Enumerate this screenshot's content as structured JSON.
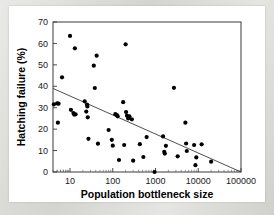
{
  "figure": {
    "background_color": "#d7d8d3",
    "card_color": "#ffffff",
    "axis_color": "#3a3a3a",
    "point_color": "#000000"
  },
  "chart_data": {
    "type": "scatter",
    "title": "",
    "xlabel": "Population bottleneck size",
    "ylabel": "Hatching failure (%)",
    "xscale": "log",
    "yscale": "linear",
    "xlim": [
      4,
      100000
    ],
    "ylim": [
      0,
      70
    ],
    "xticks": [
      10,
      100,
      1000,
      10000,
      100000
    ],
    "xtick_labels": [
      "10",
      "100",
      "1000",
      "10000",
      "100000"
    ],
    "yticks": [
      0,
      10,
      20,
      30,
      40,
      50,
      60,
      70
    ],
    "ytick_labels": [
      "0",
      "10",
      "20",
      "30",
      "40",
      "50",
      "60",
      "70"
    ],
    "grid": false,
    "legend": false,
    "series": [
      {
        "name": "populations",
        "marker": "filled-circle",
        "points": [
          [
            4.2,
            31.6
          ],
          [
            5.0,
            32.0
          ],
          [
            5.4,
            31.9
          ],
          [
            5.2,
            23.0
          ],
          [
            6.5,
            44.2
          ],
          [
            10.0,
            63.5
          ],
          [
            10.5,
            29.0
          ],
          [
            12.0,
            27.5
          ],
          [
            12.5,
            26.8
          ],
          [
            13.0,
            57.7
          ],
          [
            13.5,
            26.9
          ],
          [
            22.0,
            33.0
          ],
          [
            24.0,
            28.2
          ],
          [
            25.0,
            31.4
          ],
          [
            25.5,
            30.6
          ],
          [
            26.0,
            25.5
          ],
          [
            27.0,
            15.5
          ],
          [
            36.0,
            49.6
          ],
          [
            38.0,
            39.2
          ],
          [
            42.0,
            54.3
          ],
          [
            45.0,
            13.2
          ],
          [
            80.0,
            19.6
          ],
          [
            95.0,
            15.0
          ],
          [
            100.0,
            12.3
          ],
          [
            115.0,
            27.0
          ],
          [
            125.0,
            26.5
          ],
          [
            130.0,
            26.0
          ],
          [
            140.0,
            5.6
          ],
          [
            175.0,
            32.6
          ],
          [
            185.0,
            12.6
          ],
          [
            200.0,
            59.6
          ],
          [
            205.0,
            28.0
          ],
          [
            215.0,
            26.3
          ],
          [
            230.0,
            25.0
          ],
          [
            245.0,
            26.0
          ],
          [
            280.0,
            24.6
          ],
          [
            300.0,
            5.3
          ],
          [
            430.0,
            13.0
          ],
          [
            520.0,
            7.0
          ],
          [
            620.0,
            16.3
          ],
          [
            950.0,
            0.0
          ],
          [
            1500.0,
            16.6
          ],
          [
            1600.0,
            9.4
          ],
          [
            1650.0,
            8.6
          ],
          [
            1750.0,
            12.2
          ],
          [
            2700.0,
            39.3
          ],
          [
            3300.0,
            7.3
          ],
          [
            5000.0,
            23.0
          ],
          [
            5200.0,
            13.3
          ],
          [
            5400.0,
            9.8
          ],
          [
            8000.0,
            12.6
          ],
          [
            8600.0,
            3.2
          ],
          [
            9000.0,
            6.8
          ],
          [
            12000.0,
            12.9
          ],
          [
            20000.0,
            4.8
          ]
        ]
      }
    ],
    "trendline": {
      "name": "linear regression (log x)",
      "x_start": 4,
      "y_start": 39.0,
      "x_end": 100000,
      "y_end": 0.0,
      "style": "solid"
    }
  }
}
